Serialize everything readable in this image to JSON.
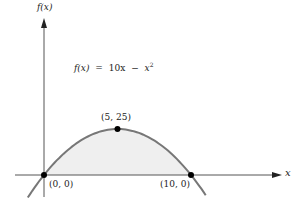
{
  "chart_data": {
    "type": "line",
    "title": "",
    "equation_label": "f(x) = 10x − x²",
    "equation_parts": {
      "lhs": "f(x)",
      "eq": "=",
      "rhs_a": "10x",
      "minus": "−",
      "rhs_b": "x",
      "exp": "2"
    },
    "xlabel": "x",
    "ylabel": "f(x)",
    "function": "10x - x^2",
    "shaded_region": {
      "from_x": 0,
      "to_x": 10,
      "color": "#efefef"
    },
    "points": [
      {
        "x": 0,
        "y": 0,
        "label": "(0, 0)"
      },
      {
        "x": 5,
        "y": 25,
        "label": "(5, 25)"
      },
      {
        "x": 10,
        "y": 0,
        "label": "(10, 0)"
      }
    ],
    "x_range_plotted": [
      -1.1,
      11.0
    ],
    "grid": false,
    "colors": {
      "curve": "#777777",
      "axis": "#555555",
      "points": "#000000",
      "fill": "#efefef"
    }
  }
}
